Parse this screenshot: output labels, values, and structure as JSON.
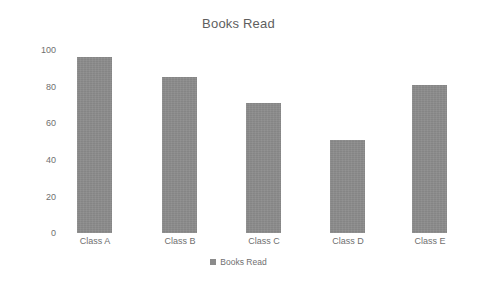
{
  "chart_data": {
    "type": "bar",
    "title": "Books Read",
    "categories": [
      "Class A",
      "Class B",
      "Class C",
      "Class D",
      "Class E"
    ],
    "values": [
      96,
      85,
      71,
      51,
      81
    ],
    "series": [
      {
        "name": "Books Read",
        "values": [
          96,
          85,
          71,
          51,
          81
        ]
      }
    ],
    "xlabel": "",
    "ylabel": "",
    "ylim": [
      0,
      100
    ],
    "yticks": [
      0,
      20,
      40,
      60,
      80,
      100
    ],
    "ytick_labels": [
      "0",
      "20",
      "40",
      "60",
      "80",
      "100"
    ],
    "grid": false,
    "legend": {
      "position": "bottom",
      "entries": [
        {
          "label": "Books Read",
          "marker": "legend-square-marker"
        }
      ]
    },
    "colors": {
      "bar": "#8b8b8b",
      "title_text": "#5e5e5e",
      "axis_text": "#6f6f6f",
      "background": "#ffffff"
    }
  }
}
